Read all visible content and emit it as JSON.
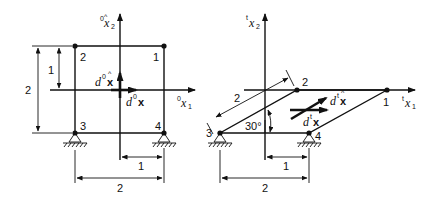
{
  "figure": {
    "left_panel": {
      "name": "original configuration (time 0)",
      "axis_x1": {
        "sup": "0",
        "base": "x",
        "sub": "1"
      },
      "axis_x2": {
        "sup": "0",
        "base": "x",
        "sub": "2"
      },
      "nodes": [
        {
          "id": "1",
          "label": "1",
          "x": 164,
          "y": 46
        },
        {
          "id": "2",
          "label": "2",
          "x": 75,
          "y": 46
        },
        {
          "id": "3",
          "label": "3",
          "x": 75,
          "y": 133
        },
        {
          "id": "4",
          "label": "4",
          "x": 164,
          "y": 133
        }
      ],
      "vector_hat": {
        "prefix": "d",
        "sup": "0",
        "base": "x",
        "hat": "^"
      },
      "vector": {
        "prefix": "d",
        "sup": "0",
        "base": "x"
      },
      "dimensions": {
        "vertical_total": "2",
        "vertical_half": "1",
        "horizontal_half": "1",
        "horizontal_total": "2"
      }
    },
    "right_panel": {
      "name": "deformed configuration (time t)",
      "axis_x1": {
        "sup": "t",
        "base": "x",
        "sub": "1"
      },
      "axis_x2": {
        "sup": "t",
        "base": "x",
        "sub": "2"
      },
      "nodes": [
        {
          "id": "1",
          "label": "1",
          "x": 387,
          "y": 90
        },
        {
          "id": "2",
          "label": "2",
          "x": 297,
          "y": 90
        },
        {
          "id": "3",
          "label": "3",
          "x": 220,
          "y": 133
        },
        {
          "id": "4",
          "label": "4",
          "x": 309,
          "y": 133
        }
      ],
      "vector_hat": {
        "prefix": "d",
        "sup": "t",
        "base": "x",
        "hat": "^"
      },
      "vector": {
        "prefix": "d",
        "sup": "t",
        "base": "x"
      },
      "angle_label": "30°",
      "dimensions": {
        "inclined_length": "2",
        "horizontal_half": "1",
        "horizontal_total": "2"
      }
    }
  }
}
